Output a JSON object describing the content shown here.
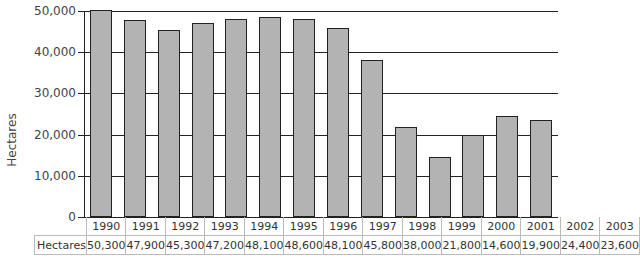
{
  "chart_data": {
    "type": "bar",
    "title": "",
    "xlabel": "",
    "ylabel": "Hectares",
    "ylim": [
      0,
      50000
    ],
    "yticks": [
      "0",
      "10,000",
      "20,000",
      "30,000",
      "40,000",
      "50,000"
    ],
    "categories": [
      "1990",
      "1991",
      "1992",
      "1993",
      "1994",
      "1995",
      "1996",
      "1997",
      "1998",
      "1999",
      "2000",
      "2001",
      "2002",
      "2003"
    ],
    "series": [
      {
        "name": "Hectares",
        "values": [
          50300,
          47900,
          45300,
          47200,
          48100,
          48600,
          48100,
          45800,
          38000,
          21800,
          14600,
          19900,
          24400,
          23600
        ],
        "labels": [
          "50,300",
          "47,900",
          "45,300",
          "47,200",
          "48,100",
          "48,600",
          "48,100",
          "45,800",
          "38,000",
          "21,800",
          "14,600",
          "19,900",
          "24,400",
          "23,600"
        ]
      }
    ],
    "grid": true,
    "legend": "data table below chart",
    "bar_color": "#b3b3b3"
  },
  "table": {
    "row_header": "Hectares"
  }
}
